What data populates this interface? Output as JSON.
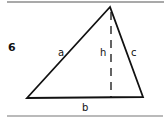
{
  "figure": {
    "number": "6",
    "shape": "triangle",
    "labels": {
      "side_a": "a",
      "side_b": "b",
      "side_c": "c",
      "height": "h"
    },
    "colors": {
      "stroke": "#111111",
      "rule": "#555555",
      "background": "#ffffff"
    }
  }
}
